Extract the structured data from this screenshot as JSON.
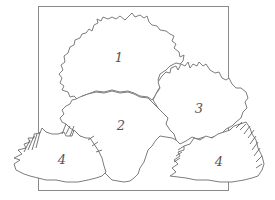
{
  "diagram": {
    "type": "planting-plan-sketch",
    "colors": {
      "line": "#6e6e6e",
      "frame": "#8a8a8a",
      "background": "#ffffff"
    },
    "plants": [
      {
        "id": "plant-1",
        "label": "1",
        "shape": "large rounded shrub, top center"
      },
      {
        "id": "plant-2",
        "label": "2",
        "shape": "mounded shrub, center"
      },
      {
        "id": "plant-3",
        "label": "3",
        "shape": "spiky-topped shrub, right"
      },
      {
        "id": "plant-4-left",
        "label": "4",
        "shape": "low grassy clump, bottom left"
      },
      {
        "id": "plant-4-right",
        "label": "4",
        "shape": "low grassy clump, bottom right"
      }
    ]
  }
}
